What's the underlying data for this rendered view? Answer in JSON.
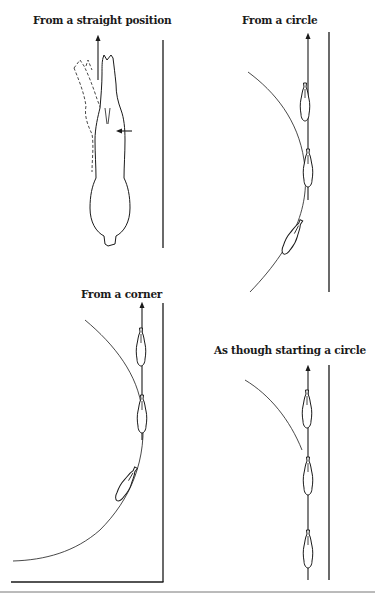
{
  "figure": {
    "panels": [
      {
        "id": "straight",
        "title": "From a straight position"
      },
      {
        "id": "circle",
        "title": "From a circle"
      },
      {
        "id": "corner",
        "title": "From a corner"
      },
      {
        "id": "starting-circle",
        "title": "As though starting a circle"
      }
    ],
    "colors": {
      "ink": "#1a1a1a",
      "background": "#ffffff",
      "rule": "#777777"
    }
  }
}
